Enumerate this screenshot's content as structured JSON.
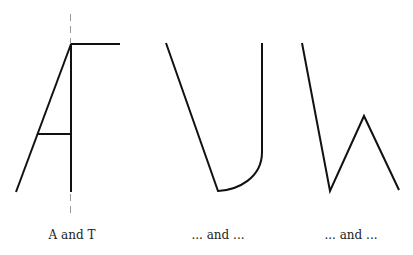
{
  "figure": {
    "panels": [
      {
        "id": "a-and-t",
        "caption": "A and T"
      },
      {
        "id": "u-shape",
        "caption": "... and ..."
      },
      {
        "id": "w-shape",
        "caption": "... and ..."
      }
    ]
  },
  "colors": {
    "stroke": "#111111",
    "guide": "#999999",
    "background": "#ffffff"
  }
}
